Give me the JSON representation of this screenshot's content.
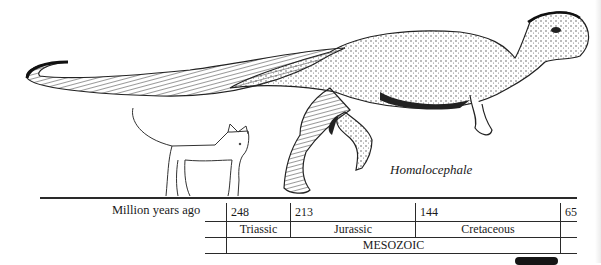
{
  "figure": {
    "species_caption": "Homalocephale",
    "scale_comparison": "house cat",
    "icons": {
      "dinosaur": "dinosaur-illustration",
      "cat": "cat-illustration"
    }
  },
  "timeline": {
    "row_label": "Million years ago",
    "ticks": [
      "248",
      "213",
      "144",
      "65"
    ],
    "periods": [
      "Triassic",
      "Jurassic",
      "Cretaceous"
    ],
    "era": "MESOZOIC"
  }
}
